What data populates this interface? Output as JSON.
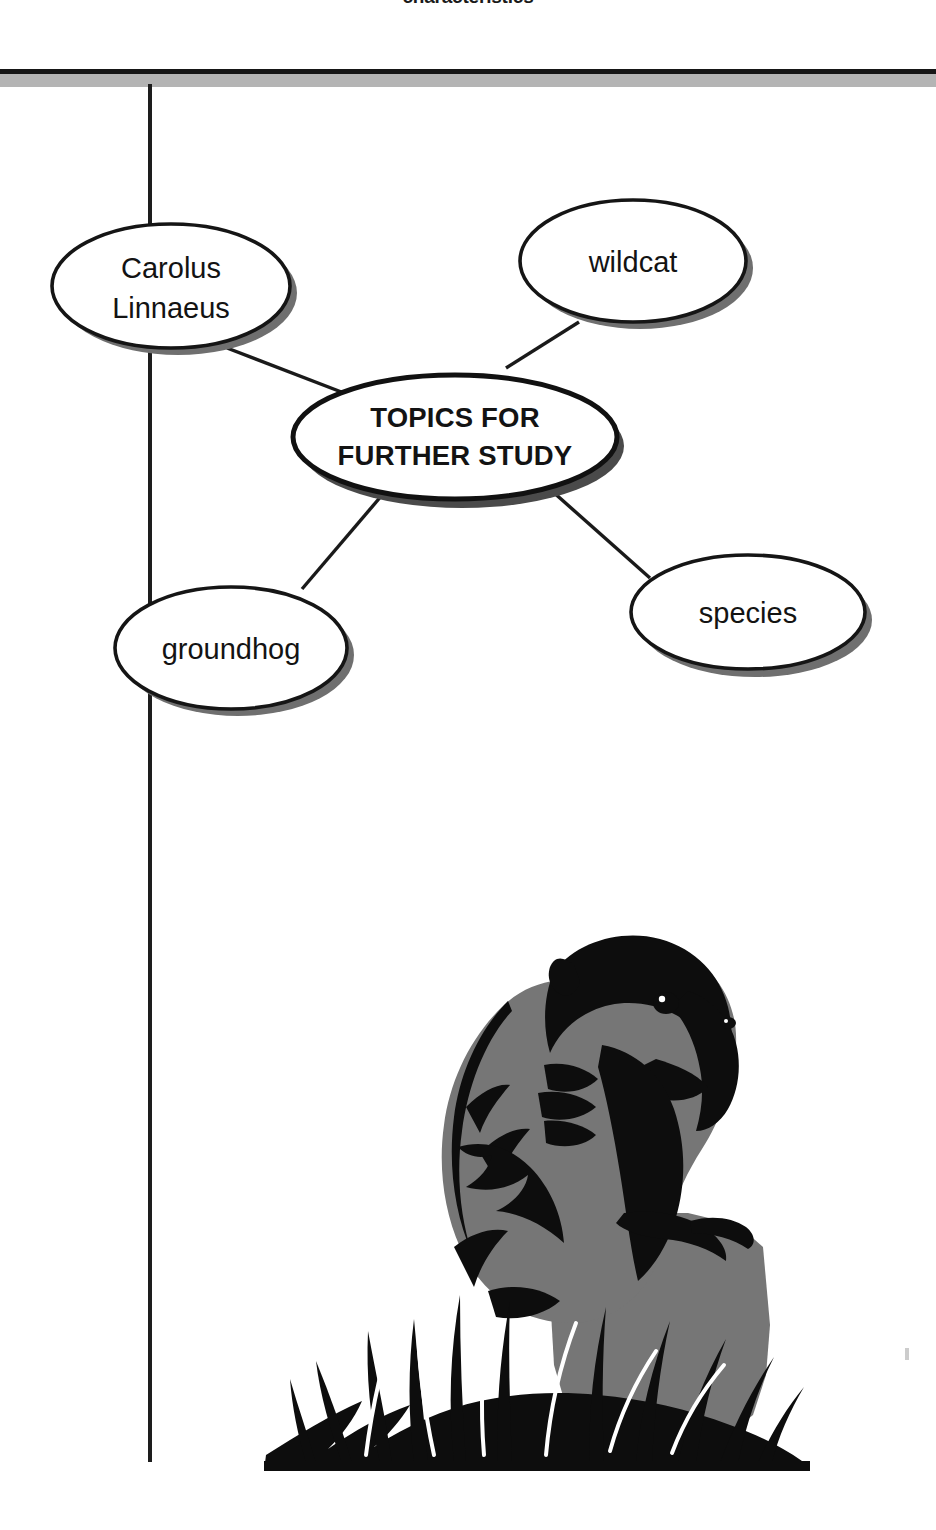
{
  "page": {
    "running_head": "characteristics",
    "width": 936,
    "height": 1530,
    "background_color": "#ffffff"
  },
  "colors": {
    "ink": "#131313",
    "rule": "#161616",
    "rule_shadow": "#b4b4b4",
    "node_fill": "#ffffff",
    "node_stroke": "#151515",
    "node_shadow": "#6b6b6b",
    "illustration_dark": "#0d0d0d",
    "illustration_mid": "#767676"
  },
  "concept_map": {
    "type": "concept-map",
    "center_node": {
      "id": "topics-for-further-study",
      "label_line1": "TOPICS FOR",
      "label_line2": "FURTHER STUDY",
      "label": "TOPICS FOR FURTHER STUDY",
      "bold": true,
      "cx": 455,
      "cy": 437,
      "rx": 162,
      "ry": 62
    },
    "nodes": [
      {
        "id": "carolus-linnaeus",
        "label_line1": "Carolus",
        "label_line2": "Linnaeus",
        "label": "Carolus Linnaeus",
        "cx": 171,
        "cy": 286,
        "rx": 119,
        "ry": 62
      },
      {
        "id": "wildcat",
        "label_line1": "wildcat",
        "label_line2": "",
        "label": "wildcat",
        "cx": 633,
        "cy": 261,
        "rx": 113,
        "ry": 61
      },
      {
        "id": "groundhog",
        "label_line1": "groundhog",
        "label_line2": "",
        "label": "groundhog",
        "cx": 231,
        "cy": 648,
        "rx": 116,
        "ry": 61
      },
      {
        "id": "species",
        "label_line1": "species",
        "label_line2": "",
        "label": "species",
        "cx": 748,
        "cy": 612,
        "rx": 117,
        "ry": 57
      }
    ],
    "edges": [
      {
        "from": "carolus-linnaeus",
        "to": "topics-for-further-study"
      },
      {
        "from": "wildcat",
        "to": "topics-for-further-study"
      },
      {
        "from": "groundhog",
        "to": "topics-for-further-study"
      },
      {
        "from": "species",
        "to": "topics-for-further-study"
      }
    ]
  },
  "illustration": {
    "id": "groundhog-illustration",
    "caption": "",
    "subject": "groundhog",
    "description": "Two-tone black and gray illustration of a groundhog sitting upright on a rock amid tall grass"
  }
}
